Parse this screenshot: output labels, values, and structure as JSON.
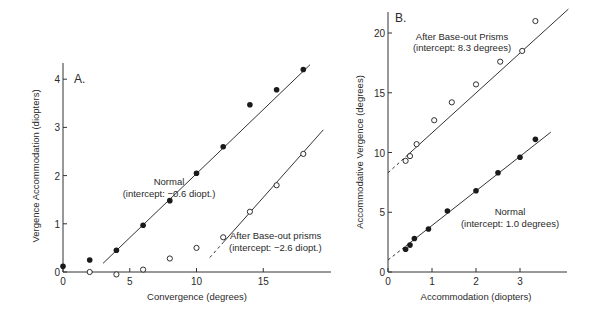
{
  "figure": {
    "panels": [
      {
        "id": "A",
        "panel_label": "A.",
        "xlabel": "Convergence (degrees)",
        "ylabel": "Vergence Accommodation (diopters)",
        "annotations": {
          "normal_line1": "Normal",
          "normal_line2": "(intercept: −0.6 diopt.)",
          "prism_line1": "After Base-out prisms",
          "prism_line2": "(intercept: −2.6 diopt.)"
        }
      },
      {
        "id": "B",
        "panel_label": "B.",
        "xlabel": "Accommodation (diopters)",
        "ylabel": "Accommodative Vergence (degrees)",
        "annotations": {
          "prism_line1": "After Base-out Prisms",
          "prism_line2": "(intercept: 8.3 degrees)",
          "normal_line1": "Normal",
          "normal_line2": "(intercept: 1.0 degrees)"
        }
      }
    ]
  },
  "chart_data": [
    {
      "type": "scatter",
      "title": "A.",
      "xlabel": "Convergence (degrees)",
      "ylabel": "Vergence Accommodation (diopters)",
      "xlim": [
        0,
        20
      ],
      "ylim": [
        0,
        4.4
      ],
      "xticks": [
        0,
        5,
        10,
        15
      ],
      "yticks": [
        0,
        1,
        2,
        3,
        4
      ],
      "grid": false,
      "legend": "inline annotations",
      "series": [
        {
          "name": "Normal",
          "marker": "filled-circle",
          "intercept_label": "intercept: -0.6 diopt.",
          "x": [
            0,
            2,
            4,
            6,
            8,
            10,
            12,
            14,
            16,
            18
          ],
          "y": [
            0.12,
            0.25,
            0.45,
            0.97,
            1.48,
            2.05,
            2.6,
            3.47,
            3.78,
            4.2
          ],
          "fit_line": {
            "x": [
              3,
              18.5
            ],
            "y": [
              0.18,
              4.3
            ]
          }
        },
        {
          "name": "After Base-out prisms",
          "marker": "open-circle",
          "intercept_label": "intercept: -2.6 diopt.",
          "x": [
            2,
            4,
            6,
            8,
            10,
            12,
            14,
            16,
            18
          ],
          "y": [
            0.0,
            -0.05,
            0.05,
            0.28,
            0.5,
            0.72,
            1.25,
            1.8,
            2.45
          ],
          "fit_line": {
            "x": [
              11,
              19.5
            ],
            "y": [
              0.3,
              2.95
            ],
            "dashed_start": [
              11,
              12
            ]
          }
        }
      ]
    },
    {
      "type": "scatter",
      "title": "B.",
      "xlabel": "Accommodation (diopters)",
      "ylabel": "Accommodative Vergence (degrees)",
      "xlim": [
        0,
        4.1
      ],
      "ylim": [
        0,
        22
      ],
      "xticks": [
        0,
        1,
        2,
        3
      ],
      "yticks": [
        0,
        5,
        10,
        15,
        20
      ],
      "grid": false,
      "legend": "inline annotations",
      "series": [
        {
          "name": "After Base-out Prisms",
          "marker": "open-circle",
          "intercept_label": "intercept: 8.3 degrees",
          "x": [
            0.4,
            0.5,
            0.65,
            1.05,
            1.45,
            2.0,
            2.55,
            3.05,
            3.35
          ],
          "y": [
            9.3,
            9.7,
            10.7,
            12.7,
            14.2,
            15.7,
            17.6,
            18.5,
            21.0
          ],
          "fit_line": {
            "x": [
              0,
              4.1
            ],
            "y": [
              8.3,
              22.0
            ],
            "dashed_start": [
              0,
              0.4
            ]
          }
        },
        {
          "name": "Normal",
          "marker": "filled-circle",
          "intercept_label": "intercept: 1.0 degrees",
          "x": [
            0.4,
            0.5,
            0.6,
            0.92,
            1.35,
            2.0,
            2.5,
            3.0,
            3.35
          ],
          "y": [
            1.9,
            2.25,
            2.8,
            3.6,
            5.1,
            6.8,
            8.3,
            9.6,
            11.1
          ],
          "fit_line": {
            "x": [
              0,
              3.7
            ],
            "y": [
              1.0,
              11.7
            ],
            "dashed_start": [
              0,
              0.4
            ]
          }
        }
      ]
    }
  ]
}
